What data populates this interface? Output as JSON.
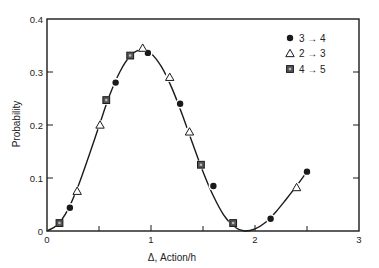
{
  "chart_data": {
    "type": "scatter",
    "title": "",
    "xlabel": "Δ, Action/h",
    "ylabel": "Probability",
    "xlim": [
      0,
      3
    ],
    "ylim": [
      0,
      0.4
    ],
    "grid": false,
    "legend_position": "upper right",
    "x_ticks": [
      0,
      1,
      2,
      3
    ],
    "x_tick_labels": [
      "0",
      "1",
      "2",
      "3"
    ],
    "x_minor_ticks": [
      0.5,
      1.5,
      2.5
    ],
    "y_ticks": [
      0,
      0.1,
      0.2,
      0.3,
      0.4
    ],
    "y_tick_labels": [
      "0",
      "0.1",
      "0.2",
      "0.3",
      "0.4"
    ],
    "series": [
      {
        "name": "3 → 4",
        "marker": "filled-circle",
        "x": [
          0.22,
          0.66,
          0.97,
          1.28,
          1.6,
          2.15,
          2.5
        ],
        "y": [
          0.044,
          0.28,
          0.336,
          0.24,
          0.085,
          0.023,
          0.112
        ]
      },
      {
        "name": "2 → 3",
        "marker": "open-triangle",
        "x": [
          0.29,
          0.51,
          0.92,
          1.18,
          1.37,
          2.4
        ],
        "y": [
          0.075,
          0.2,
          0.345,
          0.29,
          0.187,
          0.082
        ]
      },
      {
        "name": "4 → 5",
        "marker": "shaded-square",
        "x": [
          0.12,
          0.57,
          0.8,
          1.48,
          1.79
        ],
        "y": [
          0.015,
          0.247,
          0.331,
          0.125,
          0.015
        ]
      }
    ],
    "curve": {
      "style": "solid line with small breaks around markers",
      "x": [
        0.0,
        0.1,
        0.2,
        0.3,
        0.4,
        0.5,
        0.6,
        0.7,
        0.8,
        0.9,
        1.0,
        1.1,
        1.2,
        1.3,
        1.4,
        1.5,
        1.6,
        1.7,
        1.8,
        1.9,
        2.0,
        2.1,
        2.2,
        2.3,
        2.4,
        2.5
      ],
      "y": [
        0.0,
        0.012,
        0.04,
        0.085,
        0.14,
        0.198,
        0.255,
        0.3,
        0.33,
        0.342,
        0.335,
        0.31,
        0.27,
        0.22,
        0.165,
        0.112,
        0.066,
        0.03,
        0.008,
        0.0,
        0.004,
        0.016,
        0.036,
        0.06,
        0.085,
        0.112
      ]
    }
  },
  "legend": {
    "items": [
      {
        "label": "3 → 4",
        "marker": "filled-circle"
      },
      {
        "label": "2 → 3",
        "marker": "open-triangle"
      },
      {
        "label": "4 → 5",
        "marker": "shaded-square"
      }
    ]
  },
  "axes": {
    "xlabel": "Δ, Action/h",
    "ylabel": "Probability"
  },
  "colors": {
    "ink": "#1a1a1a",
    "background": "#ffffff",
    "square_fill": "#555555"
  }
}
